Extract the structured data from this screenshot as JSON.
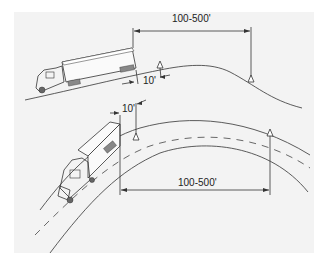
{
  "diagram": {
    "colors": {
      "panel": "#f3f3f3",
      "ink": "#333333",
      "page": "#ffffff"
    },
    "top_scene": {
      "description": "Truck stopped on hill crest",
      "distance_label": "100-500'",
      "offset_label": "10'",
      "vehicle": "tractor-trailer",
      "warning_devices": 2
    },
    "bottom_scene": {
      "description": "Truck stopped on curve",
      "distance_label": "100-500'",
      "offset_label": "10'",
      "vehicle": "tractor-trailer",
      "warning_devices": 2
    }
  }
}
